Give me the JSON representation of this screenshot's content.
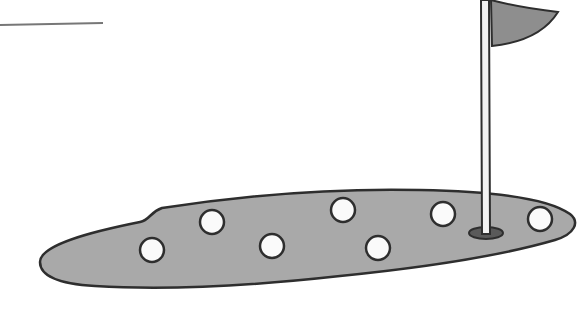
{
  "scene": {
    "description": "Cartoon golf putting green with seven golf balls, a hole and a pin flag",
    "colors": {
      "background": "#ffffff",
      "green_fill": "#a9a9a9",
      "outline": "#2e2e2e",
      "flag_fill": "#8e8e8e",
      "ball_fill": "#fafafa",
      "hole_fill": "#5a5a5a",
      "pole_fill": "#f2f2f2"
    },
    "horizon_line": {
      "x1": 0,
      "y1": 25,
      "x2": 103,
      "y2": 23
    },
    "balls": [
      {
        "cx": 152,
        "cy": 250,
        "r": 12
      },
      {
        "cx": 212,
        "cy": 222,
        "r": 12
      },
      {
        "cx": 272,
        "cy": 246,
        "r": 12
      },
      {
        "cx": 343,
        "cy": 210,
        "r": 12
      },
      {
        "cx": 378,
        "cy": 248,
        "r": 12
      },
      {
        "cx": 443,
        "cy": 214,
        "r": 12
      },
      {
        "cx": 540,
        "cy": 219,
        "r": 12
      }
    ],
    "hole": {
      "cx": 486,
      "cy": 233,
      "rx": 17,
      "ry": 6
    },
    "pole": {
      "x": 481,
      "top": 0,
      "bottom": 235,
      "width": 8
    }
  }
}
